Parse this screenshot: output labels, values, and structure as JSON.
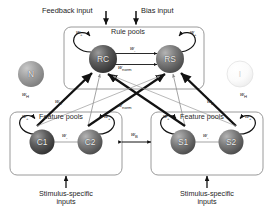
{
  "diagram": {
    "background": "#ffffff"
  },
  "inputs": {
    "feedback_label": "Feedback input",
    "bias_label": "Bias input",
    "stimulus_left": "Stimulus-specific\ninputs",
    "stimulus_left_line1": "Stimulus-specific",
    "stimulus_left_line2": "inputs",
    "stimulus_right_line1": "Stimulus-specific",
    "stimulus_right_line2": "inputs"
  },
  "boxes": {
    "rule_pools": "Rule pools",
    "feature_pools_left": "Feature pools",
    "feature_pools_right": "Feature pools"
  },
  "nodes": {
    "rule_color": "RC",
    "rule_shape": "RS",
    "color_1": "C1",
    "color_2": "C2",
    "shape_1": "S1",
    "shape_2": "S2",
    "noise": "N",
    "inhibition": "I"
  },
  "weights": {
    "rc_self": "w",
    "rc_self_sub": "+",
    "rs_self": "w",
    "rs_self_sub": "+",
    "rule_lateral": "w",
    "rule_lateral_sub": "-",
    "rule_norm": "w",
    "rule_norm_sub": "norm",
    "c_self_left": "w",
    "c_self_left_sub": "+",
    "c_self_right": "w",
    "c_self_right_sub": "+",
    "c_lateral": "w",
    "c_lateral_sub": "-",
    "s_self_left": "w",
    "s_self_left_sub": "+",
    "s_self_right": "w",
    "s_self_right_sub": "+",
    "s_lateral": "w",
    "s_lateral_sub": "-",
    "between_features": "w",
    "between_features_sub": "B",
    "diag_h_left": "w",
    "diag_h_left_sub": "H",
    "diag_d_left": "w",
    "diag_d_left_sub": "D",
    "diag_h_right": "w",
    "diag_h_right_sub": "H",
    "diag_d_right": "w",
    "diag_d_right_sub": "D",
    "feature_norm": "w",
    "feature_norm_sub": "norm"
  },
  "colors": {
    "stroke": "#1c1c1c",
    "box_border": "#9a9a9a",
    "node_dark": "#4a4a4a",
    "node_mid": "#6e6e6e",
    "node_light": "#d8d8d8",
    "thin_line": "#9b9b9b"
  }
}
